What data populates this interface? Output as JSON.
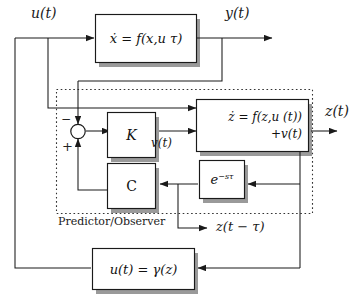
{
  "diagram": {
    "group_label": "Predictor/Observer",
    "colors": {
      "line": "#1a1a1a",
      "box_fill": "#ffffff",
      "box_stroke": "#1a1a1a",
      "shadow": "#8c8c8c",
      "dashed_border": "#3a3a3a",
      "text": "#111111",
      "background": "#ffffff"
    },
    "blocks": [
      {
        "id": "plant",
        "label": "ẋ = f(x,u τ)",
        "line1": "ẋ = f(x,u",
        "sub": "τ",
        "line2": ")"
      },
      {
        "id": "predictor",
        "label": "ż = f(z,u (t)) +v(t)",
        "line1": "ż = f(z,u (t))",
        "line2": "+v(t)"
      },
      {
        "id": "gain_k",
        "label": "K"
      },
      {
        "id": "gain_c",
        "label": "C"
      },
      {
        "id": "delay",
        "label": "e−sτ",
        "base": "e",
        "exponent": "−sτ"
      },
      {
        "id": "control",
        "label": "u(t) = γ(z)"
      }
    ],
    "signals": [
      {
        "id": "u",
        "label": "u(t)"
      },
      {
        "id": "y",
        "label": "y(t)"
      },
      {
        "id": "z",
        "label": "z(t)"
      },
      {
        "id": "v",
        "label": "v(t)"
      },
      {
        "id": "z_delay",
        "label": "z(t − τ)"
      }
    ],
    "summing_junction": {
      "minus": "−",
      "plus": "+"
    }
  }
}
